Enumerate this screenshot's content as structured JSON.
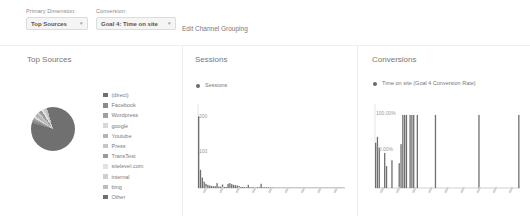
{
  "controls": {
    "primary_dimension_label": "Primary Dimension:",
    "primary_dimension_value": "Top Sources",
    "conversion_label": "Conversion:",
    "conversion_value": "Goal 4: Time on site",
    "edit_link": "Edit Channel Grouping",
    "caret": "▾"
  },
  "panels": {
    "sources": {
      "title": "Top Sources",
      "legend": [
        {
          "label": "(direct)",
          "color": "#6e6e6e",
          "value": 4.4
        },
        {
          "label": "Facebook",
          "color": "#8a8a8a",
          "value": 2.2
        },
        {
          "label": "Wordpress",
          "color": "#a0a0a0",
          "value": 1.7
        },
        {
          "label": "google",
          "color": "#d8d8d8",
          "value": 1.7
        },
        {
          "label": "Youtube",
          "color": "#b4b4b4",
          "value": 2.2
        },
        {
          "label": "Press",
          "color": "#c6c6c6",
          "value": 1.7
        },
        {
          "label": "TransTest",
          "color": "#9a9a9a",
          "value": 2.2
        },
        {
          "label": "sitelevel.com",
          "color": "#e2e2e2",
          "value": 1.4
        },
        {
          "label": "internal",
          "color": "#cfcfcf",
          "value": 1.4
        },
        {
          "label": "bing",
          "color": "#bdbdbd",
          "value": 1.7
        },
        {
          "label": "Other",
          "color": "#707070",
          "value": 79.4
        }
      ]
    },
    "sessions": {
      "title": "Sessions",
      "legend_label": "Sessions",
      "legend_color": "#6b6b6b"
    },
    "conversions": {
      "title": "Conversions",
      "legend_label": "Time on site (Goal 4 Conversion Rate)",
      "legend_color": "#6b6b6b"
    }
  },
  "chart_data": [
    {
      "type": "bar",
      "title": "Sessions",
      "series_name": "Sessions",
      "xlabel": "",
      "ylabel": "",
      "ylim": [
        0,
        240
      ],
      "yticks": [
        100,
        200
      ],
      "ytick_labels": [
        "100",
        "200"
      ],
      "grid": false,
      "legend_position": "top-left",
      "values": [
        205,
        52,
        30,
        18,
        12,
        9,
        7,
        6,
        5,
        5,
        14,
        4,
        4,
        10,
        3,
        3,
        12,
        14,
        11,
        9,
        8,
        7,
        6,
        3,
        3,
        2,
        2,
        9,
        2,
        2,
        2,
        2,
        2,
        2,
        12,
        2,
        2,
        2,
        2,
        2,
        2,
        1,
        1,
        1,
        1,
        1,
        1,
        1,
        1,
        1,
        1,
        1,
        1,
        1,
        1,
        1,
        1,
        1,
        1,
        1,
        1,
        1,
        1,
        1,
        1,
        1,
        1,
        1,
        1,
        1,
        1,
        1,
        1,
        1,
        1,
        1,
        1,
        1,
        1,
        1
      ]
    },
    {
      "type": "bar",
      "title": "Conversions",
      "series_name": "Time on site (Goal 4 Conversion Rate)",
      "xlabel": "",
      "ylabel": "",
      "ylim": [
        0,
        115
      ],
      "yticks": [
        50,
        100
      ],
      "ytick_labels": [
        "50.00%",
        "100.00%"
      ],
      "grid": false,
      "legend_position": "top-left",
      "values": [
        62,
        70,
        55,
        0,
        0,
        48,
        30,
        0,
        0,
        38,
        0,
        0,
        0,
        34,
        60,
        100,
        100,
        100,
        0,
        100,
        100,
        100,
        0,
        100,
        0,
        0,
        0,
        0,
        0,
        0,
        0,
        0,
        0,
        100,
        0,
        0,
        0,
        0,
        0,
        0,
        0,
        0,
        0,
        0,
        0,
        0,
        0,
        0,
        0,
        0,
        0,
        0,
        0,
        0,
        0,
        0,
        0,
        100,
        0,
        0,
        0,
        0,
        0,
        0,
        0,
        0,
        0,
        0,
        0,
        0,
        0,
        0,
        0,
        0,
        0,
        0,
        0,
        0,
        0,
        100
      ]
    }
  ]
}
